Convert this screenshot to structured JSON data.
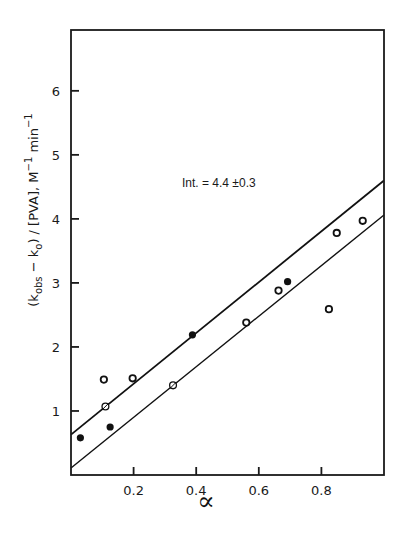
{
  "chart_data": {
    "type": "scatter",
    "title": "",
    "xlabel": "∝",
    "ylabel": "(k_obs − k_o) / [PVA], M⁻¹ min⁻¹",
    "xlim": [
      0,
      1.0
    ],
    "ylim": [
      0,
      6.95
    ],
    "x_ticks": [
      0.2,
      0.4,
      0.6,
      0.8
    ],
    "x_tick_labels": [
      "0.2",
      "0.4",
      "0.6",
      "0.8"
    ],
    "y_ticks": [
      1,
      2,
      3,
      4,
      5,
      6
    ],
    "y_tick_labels": [
      "1",
      "2",
      "3",
      "4",
      "5",
      "6"
    ],
    "grid": false,
    "legend": null,
    "annotations": [
      {
        "text": "Int. = 4.4 ±0.3",
        "x": 0.36,
        "y": 4.55
      }
    ],
    "series": [
      {
        "name": "open circles",
        "marker": "open-circle",
        "points": [
          {
            "x": 0.105,
            "y": 1.49
          },
          {
            "x": 0.197,
            "y": 1.51
          },
          {
            "x": 0.56,
            "y": 2.38
          },
          {
            "x": 0.663,
            "y": 2.88
          },
          {
            "x": 0.824,
            "y": 2.59
          },
          {
            "x": 0.849,
            "y": 3.78
          },
          {
            "x": 0.932,
            "y": 3.97
          }
        ]
      },
      {
        "name": "slashed open circles",
        "marker": "slashed-circle",
        "points": [
          {
            "x": 0.11,
            "y": 1.07
          },
          {
            "x": 0.326,
            "y": 1.4
          }
        ]
      },
      {
        "name": "filled circles",
        "marker": "filled-circle",
        "points": [
          {
            "x": 0.03,
            "y": 0.58
          },
          {
            "x": 0.125,
            "y": 0.75
          },
          {
            "x": 0.388,
            "y": 2.19
          },
          {
            "x": 0.692,
            "y": 3.02
          }
        ]
      }
    ],
    "lines": [
      {
        "name": "upper bound line",
        "x0": 0.0,
        "y0": 0.63,
        "x1": 1.0,
        "y1": 4.6,
        "width": 1.8
      },
      {
        "name": "lower bound line",
        "x0": 0.0,
        "y0": 0.11,
        "x1": 1.0,
        "y1": 4.06,
        "width": 1.4
      }
    ]
  },
  "layout": {
    "plot_px": {
      "left": 71,
      "top": 30,
      "right": 384,
      "bottom": 475
    }
  }
}
